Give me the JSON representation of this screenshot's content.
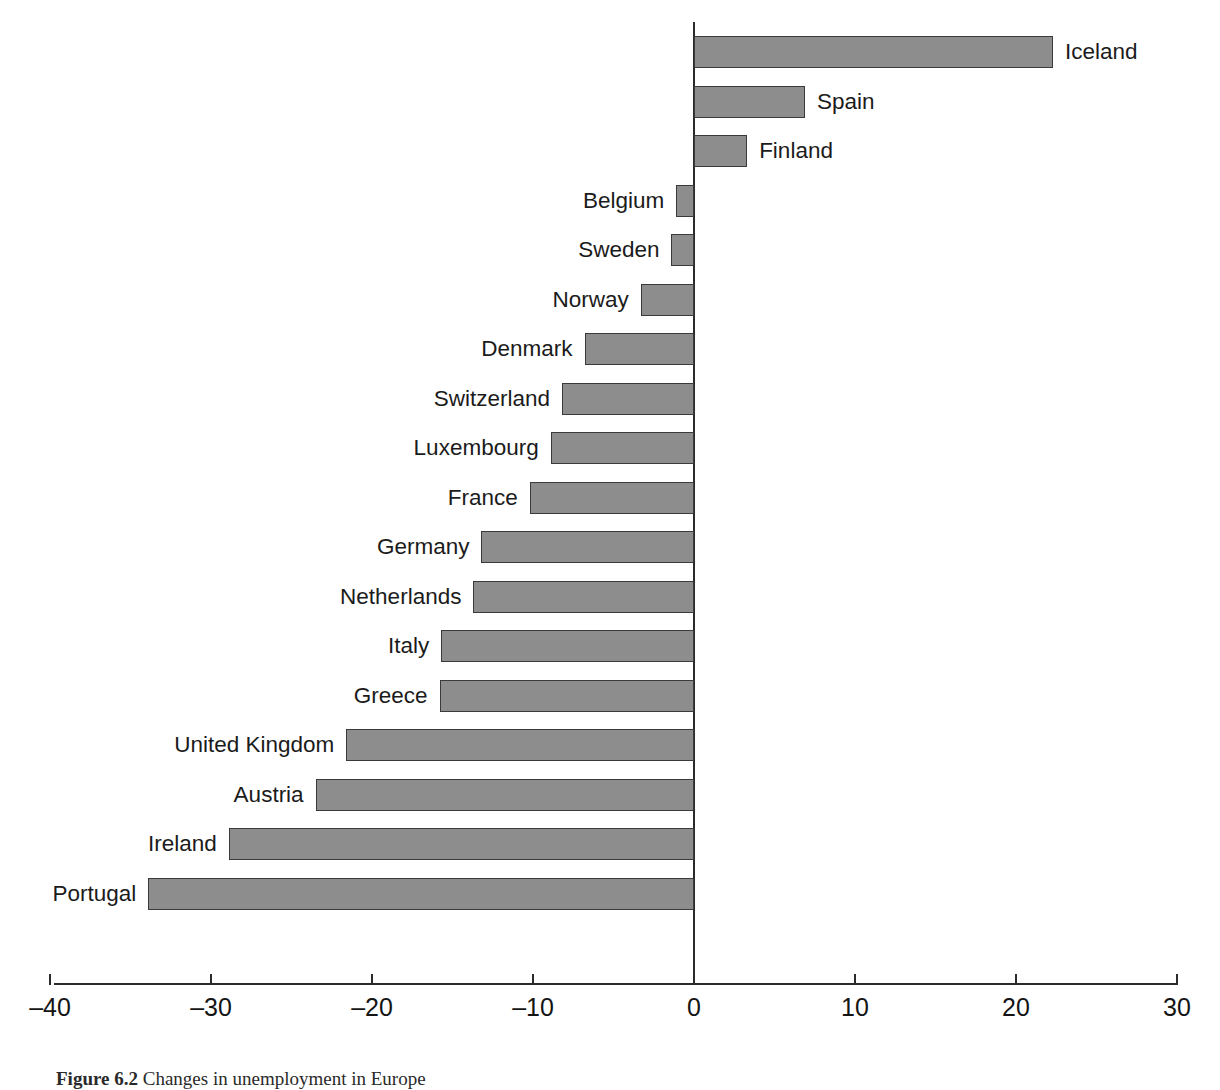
{
  "chart_data": {
    "type": "bar",
    "orientation": "horizontal",
    "title": "",
    "subtitle": "",
    "xlabel": "",
    "ylabel": "",
    "xlim": [
      -40,
      30
    ],
    "xticks": [
      -40,
      -30,
      -20,
      -10,
      0,
      10,
      20,
      30
    ],
    "xtick_labels": [
      "–40",
      "–30",
      "–20",
      "–10",
      "0",
      "10",
      "20",
      "30"
    ],
    "grid": false,
    "legend": null,
    "bar_color": "#8d8d8d",
    "bar_edge_color": "#3a3a3a",
    "background_color": "#ffffff",
    "categories": [
      "Iceland",
      "Spain",
      "Finland",
      "Belgium",
      "Sweden",
      "Norway",
      "Denmark",
      "Switzerland",
      "Luxembourg",
      "France",
      "Germany",
      "Netherlands",
      "Italy",
      "Greece",
      "United Kingdom",
      "Austria",
      "Ireland",
      "Portugal"
    ],
    "values": [
      22.3,
      6.9,
      3.3,
      -1.1,
      -1.4,
      -3.3,
      -6.8,
      -8.2,
      -8.9,
      -10.2,
      -13.2,
      -13.7,
      -15.7,
      -15.8,
      -21.6,
      -23.5,
      -28.9,
      -33.9
    ]
  },
  "caption": {
    "number": "Figure 6.2",
    "text": "Changes in unemployment in Europe"
  }
}
